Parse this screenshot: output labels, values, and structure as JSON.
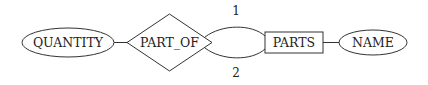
{
  "diagram": {
    "type": "er-diagram",
    "nodes": [
      {
        "id": "quantity",
        "kind": "attribute",
        "shape": "ellipse",
        "label": "QUANTITY"
      },
      {
        "id": "part_of",
        "kind": "relationship",
        "shape": "diamond",
        "label": "PART_OF"
      },
      {
        "id": "parts",
        "kind": "entity",
        "shape": "rectangle",
        "label": "PARTS"
      },
      {
        "id": "name",
        "kind": "attribute",
        "shape": "ellipse",
        "label": "NAME"
      }
    ],
    "edges": [
      {
        "from": "quantity",
        "to": "part_of",
        "label": ""
      },
      {
        "from": "part_of",
        "to": "parts",
        "label": "1",
        "role": "upper"
      },
      {
        "from": "part_of",
        "to": "parts",
        "label": "2",
        "role": "lower"
      },
      {
        "from": "parts",
        "to": "name",
        "label": ""
      }
    ],
    "edge_labels": {
      "upper": "1",
      "lower": "2"
    }
  }
}
